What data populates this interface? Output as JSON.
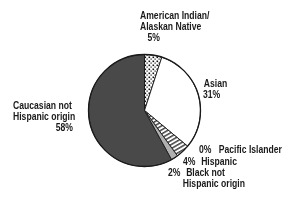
{
  "chart_data": {
    "type": "pie",
    "title": "",
    "start_angle_deg": 0,
    "direction": "clockwise",
    "slices": [
      {
        "label": "American Indian/ Alaskan Native",
        "value": 5,
        "display": "5%",
        "fill": "dots"
      },
      {
        "label": "Asian",
        "value": 31,
        "display": "31%",
        "fill": "#ffffff"
      },
      {
        "label": "Pacific Islander",
        "value": 0,
        "display": "0%",
        "fill": "#ffffff"
      },
      {
        "label": "Hispanic",
        "value": 4,
        "display": "4%",
        "fill": "hatch"
      },
      {
        "label": "Black not Hispanic origin",
        "value": 2,
        "display": "2%",
        "fill": "#b0b0b0"
      },
      {
        "label": "Caucasian not Hispanic origin",
        "value": 58,
        "display": "58%",
        "fill": "#4a4a4a"
      }
    ]
  },
  "labels": {
    "amind_line1": "American Indian/",
    "amind_line2": "Alaskan Native",
    "amind_pct": "5%",
    "asian_line1": "Asian",
    "asian_pct": "31%",
    "pacific_pct": "0%",
    "pacific_line1": "Pacific Islander",
    "hispanic_pct": "4%",
    "hispanic_line1": "Hispanic",
    "black_pct": "2%",
    "black_line1": "Black not",
    "black_line2": "Hispanic origin",
    "cauc_line1": "Caucasian not",
    "cauc_line2": "Hispanic origin",
    "cauc_pct": "58%"
  },
  "colors": {
    "outline": "#1a1a1a",
    "caucasian": "#4a4a4a",
    "black": "#b0b0b0",
    "asian": "#ffffff"
  }
}
